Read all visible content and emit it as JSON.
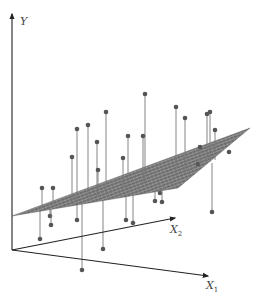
{
  "figure": {
    "axes": {
      "y": {
        "label": "Y",
        "start": [
          12,
          250
        ],
        "end": [
          12,
          14
        ],
        "label_pos": [
          20,
          24
        ]
      },
      "x1": {
        "label": "X",
        "subscript": "1",
        "start": [
          12,
          250
        ],
        "end": [
          208,
          276
        ],
        "label_pos": [
          206,
          288
        ]
      },
      "x2": {
        "label": "X",
        "subscript": "2",
        "start": [
          12,
          250
        ],
        "end": [
          175,
          218
        ],
        "label_pos": [
          172,
          232
        ]
      }
    },
    "plane": {
      "corners": [
        [
          12,
          216
        ],
        [
          95,
          176
        ],
        [
          250,
          128
        ],
        [
          180,
          170
        ],
        [
          120,
          192
        ]
      ],
      "polygon": [
        [
          12,
          216
        ],
        [
          250,
          128
        ],
        [
          178,
          186
        ],
        [
          12,
          216
        ]
      ],
      "fill": "#6b6b6b",
      "grid_color": "#d9d9d9"
    },
    "colors": {
      "axis": "#222222",
      "point": "#555555",
      "residual": "#777777",
      "label": "#444444"
    },
    "points": [
      {
        "x": 77,
        "y": 129,
        "py": 201
      },
      {
        "x": 88,
        "y": 125,
        "py": 198
      },
      {
        "x": 97,
        "y": 142,
        "py": 196
      },
      {
        "x": 106,
        "y": 112,
        "py": 193
      },
      {
        "x": 128,
        "y": 136,
        "py": 188
      },
      {
        "x": 145,
        "y": 94,
        "py": 182
      },
      {
        "x": 176,
        "y": 107,
        "py": 176
      },
      {
        "x": 185,
        "y": 118,
        "py": 173
      },
      {
        "x": 207,
        "y": 114,
        "py": 163
      },
      {
        "x": 210,
        "y": 112,
        "py": 162
      },
      {
        "x": 215,
        "y": 130,
        "py": 160
      },
      {
        "x": 143,
        "y": 136,
        "py": 183
      },
      {
        "x": 42,
        "y": 188,
        "py": 208
      },
      {
        "x": 53,
        "y": 188,
        "py": 205
      },
      {
        "x": 72,
        "y": 157,
        "py": 202
      },
      {
        "x": 40,
        "y": 239,
        "py": 211
      },
      {
        "x": 50,
        "y": 216,
        "py": 209
      },
      {
        "x": 51,
        "y": 225,
        "py": 208
      },
      {
        "x": 77,
        "y": 220,
        "py": 201
      },
      {
        "x": 82,
        "y": 270,
        "py": 200
      },
      {
        "x": 103,
        "y": 249,
        "py": 194
      },
      {
        "x": 126,
        "y": 220,
        "py": 189
      },
      {
        "x": 133,
        "y": 223,
        "py": 187
      },
      {
        "x": 155,
        "y": 201,
        "py": 181
      },
      {
        "x": 160,
        "y": 193,
        "py": 179
      },
      {
        "x": 162,
        "y": 202,
        "py": 179
      },
      {
        "x": 175,
        "y": 185,
        "py": 176
      },
      {
        "x": 181,
        "y": 179,
        "py": 175
      },
      {
        "x": 177,
        "y": 185,
        "py": 176
      },
      {
        "x": 212,
        "y": 212,
        "py": 163
      },
      {
        "x": 198,
        "y": 164,
        "py": 166
      },
      {
        "x": 229,
        "y": 152,
        "py": 150
      },
      {
        "x": 123,
        "y": 158,
        "py": 189
      },
      {
        "x": 200,
        "y": 147,
        "py": 165
      },
      {
        "x": 98,
        "y": 170,
        "py": 195
      }
    ]
  }
}
